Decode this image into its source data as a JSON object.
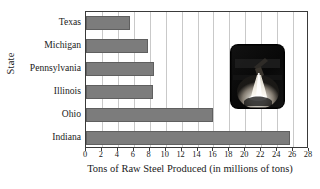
{
  "chart_data": {
    "type": "bar",
    "orientation": "horizontal",
    "title": "",
    "xlabel": "Tons of Raw Steel Produced (in millions of tons)",
    "ylabel": "State",
    "categories": [
      "Texas",
      "Michigan",
      "Pennsylvania",
      "Illinois",
      "Ohio",
      "Indiana"
    ],
    "values": [
      5.5,
      7.8,
      8.5,
      8.4,
      15.9,
      25.6
    ],
    "xlim": [
      0,
      28
    ],
    "xticks": [
      0,
      2,
      4,
      6,
      8,
      10,
      12,
      14,
      16,
      18,
      20,
      22,
      24,
      26,
      28
    ],
    "xtick_labels": [
      "0",
      "2",
      "4",
      "6",
      "8",
      "10",
      "12",
      "14",
      "16",
      "18",
      "20",
      "22",
      "24",
      "26",
      "28"
    ],
    "grid": "vertical",
    "legend": "none",
    "bar_color": "#7c7c7c",
    "bar_edge_color": "#5f5f5f",
    "grid_color": "#c9c9c9",
    "frame_color": "#3a3a3a"
  },
  "inset": {
    "name": "molten-steel-photo",
    "description": "Dark photograph of a ladle pouring molten steel"
  }
}
